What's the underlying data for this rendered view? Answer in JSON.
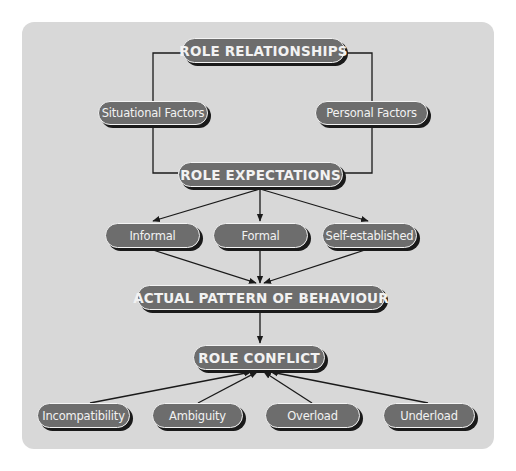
{
  "diagram": {
    "colors": {
      "panel": "#d8d8d8",
      "node_fill": "#6d6d6d",
      "node_text": "#f2f2f2",
      "node_border": "#f4f4f4",
      "shadow": "#1a1a1a",
      "line": "#1a1a1a"
    },
    "nodes": {
      "role_relationships": "ROLE RELATIONSHIPS",
      "situational_factors": "Situational Factors",
      "personal_factors": "Personal Factors",
      "role_expectations": "ROLE EXPECTATIONS",
      "informal": "Informal",
      "formal": "Formal",
      "self_established": "Self-established",
      "actual_pattern": "ACTUAL PATTERN OF BEHAVIOUR",
      "role_conflict": "ROLE CONFLICT",
      "incompatibility": "Incompatibility",
      "ambiguity": "Ambiguity",
      "overload": "Overload",
      "underload": "Underload"
    },
    "edges": [
      {
        "from": "role_relationships",
        "to": "situational_factors",
        "type": "line"
      },
      {
        "from": "role_relationships",
        "to": "personal_factors",
        "type": "line"
      },
      {
        "from": "situational_factors",
        "to": "role_expectations",
        "type": "line"
      },
      {
        "from": "personal_factors",
        "to": "role_expectations",
        "type": "line"
      },
      {
        "from": "role_expectations",
        "to": "informal",
        "type": "arrow"
      },
      {
        "from": "role_expectations",
        "to": "formal",
        "type": "arrow"
      },
      {
        "from": "role_expectations",
        "to": "self_established",
        "type": "arrow"
      },
      {
        "from": "informal",
        "to": "actual_pattern",
        "type": "arrow"
      },
      {
        "from": "formal",
        "to": "actual_pattern",
        "type": "arrow"
      },
      {
        "from": "self_established",
        "to": "actual_pattern",
        "type": "arrow"
      },
      {
        "from": "actual_pattern",
        "to": "role_conflict",
        "type": "arrow"
      },
      {
        "from": "incompatibility",
        "to": "role_conflict",
        "type": "arrow"
      },
      {
        "from": "ambiguity",
        "to": "role_conflict",
        "type": "arrow"
      },
      {
        "from": "overload",
        "to": "role_conflict",
        "type": "arrow"
      },
      {
        "from": "underload",
        "to": "role_conflict",
        "type": "arrow"
      }
    ]
  }
}
